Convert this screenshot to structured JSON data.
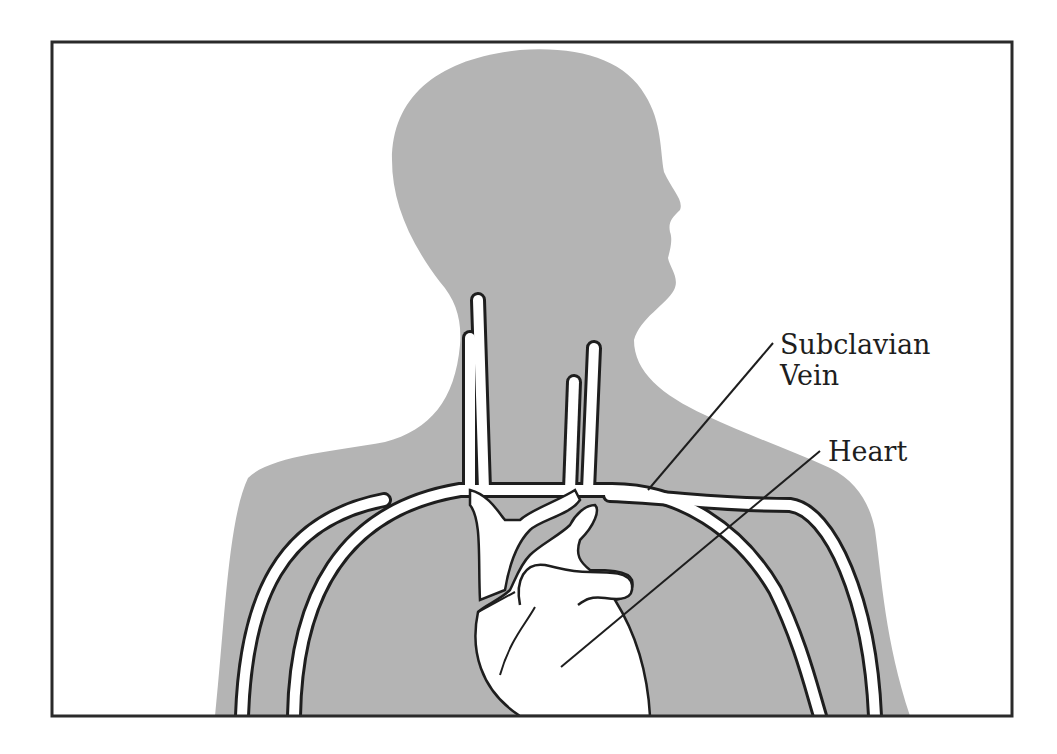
{
  "figure": {
    "colors": {
      "background": "#ffffff",
      "silhouette": "#b4b4b4",
      "vessel_fill": "#ffffff",
      "outline": "#1e1e1e",
      "frame": "#2a2a2a"
    },
    "labels": {
      "subclavian_line1": "Subclavian",
      "subclavian_line2": "Vein",
      "heart": "Heart"
    }
  }
}
